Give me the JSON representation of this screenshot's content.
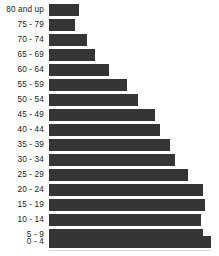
{
  "chart": {
    "title": "",
    "background_color": "#ffffff",
    "bar_color": "#353535",
    "label_color": "#1b1b1b"
  },
  "chart_data": {
    "type": "bar",
    "orientation": "horizontal",
    "title": "",
    "subtitle": "",
    "xlabel": "",
    "ylabel": "",
    "grid": false,
    "legend": false,
    "axis_visible": false,
    "tick_labels_x": [],
    "xlim": [
      0,
      100
    ],
    "categories": [
      "80 and up",
      "75 - 79",
      "70 - 74",
      "65 - 69",
      "60 - 64",
      "55 - 59",
      "50 - 54",
      "45 - 49",
      "40 - 44",
      "35 - 39",
      "30 - 34",
      "25 - 29",
      "20 - 24",
      "15 - 19",
      "10 - 14",
      "5 - 9",
      "0 - 4"
    ],
    "values": [
      18.5,
      16.0,
      23.5,
      28.5,
      37.0,
      48.0,
      55.0,
      65.5,
      68.5,
      74.5,
      78.0,
      85.5,
      95.0,
      96.5,
      94.0,
      95.0,
      100.0
    ],
    "series": [
      {
        "name": "Population",
        "values": [
          18.5,
          16.0,
          23.5,
          28.5,
          37.0,
          48.0,
          55.0,
          65.5,
          68.5,
          74.5,
          78.0,
          85.5,
          95.0,
          96.5,
          94.0,
          95.0,
          100.0
        ]
      }
    ],
    "annotations": []
  }
}
